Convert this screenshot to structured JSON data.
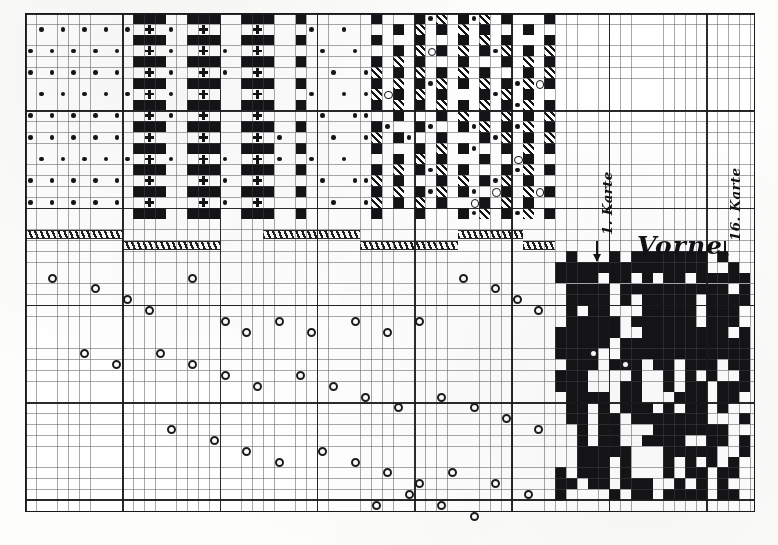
{
  "figure": {
    "kind": "jacquard-point-paper-chart",
    "medium": "printed graph paper plate",
    "ink_color": "#141416",
    "paper_color": "#fdfdfb",
    "grid": {
      "cell_px": 10.82,
      "heavy_every_cells": 9,
      "plate_left": 25,
      "plate_top": 13,
      "plate_width": 730,
      "plate_height": 499,
      "fine_line_color": "#46464b",
      "heavy_line_color": "#19191c"
    }
  },
  "labels": {
    "vorne": "Vorne",
    "karte_first": "1. Karte",
    "karte_last": "16. Karte"
  },
  "legend_marks": {
    "solid": "solid-black-square",
    "hatch": "diagonal-hatched-square",
    "dot": "filled-dot",
    "ring": "open-circle",
    "cross": "plus-cross"
  },
  "chart_data": {
    "type": "heatmap",
    "title": "Vorne",
    "xlabel": "",
    "ylabel": "",
    "grid": true,
    "legend_position": "none",
    "annotations": [
      "1. Karte",
      "Vorne",
      "16. Karte"
    ],
    "pattern_block_top": {
      "description": "upper weave-pattern band: dots, crosses, solid and hatched cells",
      "origin_col": 0,
      "origin_row": 0,
      "cols": 49,
      "rows": 19,
      "cells": [
        {
          "c": 1,
          "r": 1,
          "m": "dot"
        },
        {
          "c": 3,
          "r": 1,
          "m": "dot"
        },
        {
          "c": 5,
          "r": 1,
          "m": "dot"
        },
        {
          "c": 7,
          "r": 1,
          "m": "dot"
        },
        {
          "c": 10,
          "r": 1,
          "m": "dot"
        },
        {
          "c": 12,
          "r": 0,
          "m": "solid"
        },
        {
          "c": 13,
          "r": 0,
          "m": "solid"
        },
        {
          "c": 14,
          "r": 0,
          "m": "solid"
        },
        {
          "c": 15,
          "r": 1,
          "m": "dot"
        },
        {
          "c": 12,
          "r": 1,
          "m": "cross"
        },
        {
          "c": 13,
          "r": 1,
          "m": "cross"
        },
        {
          "c": 12,
          "r": 2,
          "m": "solid"
        },
        {
          "c": 13,
          "r": 2,
          "m": "solid"
        },
        {
          "c": 14,
          "r": 2,
          "m": "solid"
        },
        {
          "c": 15,
          "r": 2,
          "m": "dot"
        },
        {
          "c": 17,
          "r": 0,
          "m": "solid"
        },
        {
          "c": 18,
          "r": 0,
          "m": "solid"
        },
        {
          "c": 19,
          "r": 0,
          "m": "solid"
        },
        {
          "c": 20,
          "r": 0,
          "m": "solid"
        },
        {
          "c": 18,
          "r": 1,
          "m": "cross"
        },
        {
          "c": 19,
          "r": 1,
          "m": "cross"
        },
        {
          "c": 17,
          "r": 2,
          "m": "solid"
        },
        {
          "c": 18,
          "r": 2,
          "m": "solid"
        },
        {
          "c": 19,
          "r": 2,
          "m": "solid"
        },
        {
          "c": 20,
          "r": 2,
          "m": "solid"
        },
        {
          "c": 23,
          "r": 0,
          "m": "solid"
        },
        {
          "c": 24,
          "r": 0,
          "m": "solid"
        },
        {
          "c": 25,
          "r": 0,
          "m": "solid"
        },
        {
          "c": 23,
          "r": 1,
          "m": "cross"
        },
        {
          "c": 24,
          "r": 1,
          "m": "cross"
        },
        {
          "c": 23,
          "r": 2,
          "m": "solid"
        },
        {
          "c": 24,
          "r": 2,
          "m": "solid"
        },
        {
          "c": 25,
          "r": 2,
          "m": "solid"
        },
        {
          "c": 27,
          "r": 1,
          "m": "dot"
        },
        {
          "c": 29,
          "r": 1,
          "m": "dot"
        },
        {
          "c": 31,
          "r": 1,
          "m": "dot"
        },
        {
          "c": 34,
          "r": 0,
          "m": "solid"
        },
        {
          "c": 35,
          "r": 1,
          "m": "dot"
        },
        {
          "c": 36,
          "r": 0,
          "m": "solid"
        },
        {
          "c": 38,
          "r": 0,
          "m": "solid"
        },
        {
          "c": 39,
          "r": 1,
          "m": "hatch"
        },
        {
          "c": 40,
          "r": 0,
          "m": "solid"
        },
        {
          "c": 42,
          "r": 1,
          "m": "dot"
        },
        {
          "c": 43,
          "r": 0,
          "m": "solid"
        },
        {
          "c": 44,
          "r": 1,
          "m": "ring"
        },
        {
          "c": 45,
          "r": 0,
          "m": "solid"
        }
      ]
    },
    "pattern_block_bottom_right": {
      "description": "lower-right dense binary card-pattern block",
      "origin_col": 49,
      "origin_row": 22,
      "cols": 18,
      "rows": 23,
      "fill_ratio": 0.46
    },
    "hatched_bars": {
      "description": "two interleaved rows of diagonally hatched bars between the pattern band and the scatter field",
      "row_a_y_cells": 20,
      "row_b_y_cells": 21,
      "segments": [
        {
          "row": "a",
          "start_col": 0,
          "end_col": 9
        },
        {
          "row": "b",
          "start_col": 9,
          "end_col": 18
        },
        {
          "row": "a",
          "start_col": 22,
          "end_col": 31
        },
        {
          "row": "b",
          "start_col": 31,
          "end_col": 40
        },
        {
          "row": "a",
          "start_col": 40,
          "end_col": 46
        },
        {
          "row": "b",
          "start_col": 46,
          "end_col": 49
        }
      ]
    },
    "scatter": {
      "description": "open-circle points forming repeated descending diagonal runs (card-lifting sequence)",
      "marker": "open-circle",
      "points": [
        {
          "x": 2,
          "y": 24
        },
        {
          "x": 6,
          "y": 25
        },
        {
          "x": 9,
          "y": 26
        },
        {
          "x": 11,
          "y": 27
        },
        {
          "x": 15,
          "y": 24
        },
        {
          "x": 18,
          "y": 28
        },
        {
          "x": 20,
          "y": 29
        },
        {
          "x": 23,
          "y": 28
        },
        {
          "x": 26,
          "y": 29
        },
        {
          "x": 30,
          "y": 28
        },
        {
          "x": 33,
          "y": 29
        },
        {
          "x": 36,
          "y": 28
        },
        {
          "x": 40,
          "y": 24
        },
        {
          "x": 43,
          "y": 25
        },
        {
          "x": 45,
          "y": 26
        },
        {
          "x": 47,
          "y": 27
        },
        {
          "x": 52,
          "y": 31
        },
        {
          "x": 55,
          "y": 32
        },
        {
          "x": 5,
          "y": 31
        },
        {
          "x": 8,
          "y": 32
        },
        {
          "x": 12,
          "y": 31
        },
        {
          "x": 15,
          "y": 32
        },
        {
          "x": 18,
          "y": 33
        },
        {
          "x": 21,
          "y": 34
        },
        {
          "x": 25,
          "y": 33
        },
        {
          "x": 28,
          "y": 34
        },
        {
          "x": 31,
          "y": 35
        },
        {
          "x": 34,
          "y": 36
        },
        {
          "x": 38,
          "y": 35
        },
        {
          "x": 41,
          "y": 36
        },
        {
          "x": 44,
          "y": 37
        },
        {
          "x": 47,
          "y": 38
        },
        {
          "x": 13,
          "y": 38
        },
        {
          "x": 17,
          "y": 39
        },
        {
          "x": 20,
          "y": 40
        },
        {
          "x": 23,
          "y": 41
        },
        {
          "x": 27,
          "y": 40
        },
        {
          "x": 30,
          "y": 41
        },
        {
          "x": 33,
          "y": 42
        },
        {
          "x": 36,
          "y": 43
        },
        {
          "x": 39,
          "y": 42
        },
        {
          "x": 43,
          "y": 43
        },
        {
          "x": 46,
          "y": 44
        },
        {
          "x": 32,
          "y": 45
        },
        {
          "x": 35,
          "y": 44
        },
        {
          "x": 38,
          "y": 45
        },
        {
          "x": 41,
          "y": 46
        }
      ]
    }
  }
}
